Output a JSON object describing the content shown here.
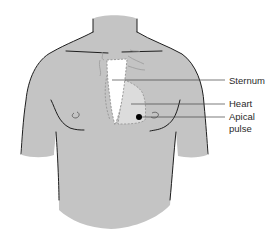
{
  "diagram": {
    "colors": {
      "skin": "#c4c4c4",
      "outline": "#1e1e1e",
      "sternum": "#ffffff",
      "heart": "#dcdcdc",
      "pulse_dot": "#000000",
      "leader_line": "#444444",
      "text": "#2a2a2a"
    },
    "labels": [
      {
        "id": "sternum",
        "text": "Sternum"
      },
      {
        "id": "heart",
        "text": "Heart"
      },
      {
        "id": "apical",
        "line1": "Apical",
        "line2": "pulse"
      }
    ]
  }
}
